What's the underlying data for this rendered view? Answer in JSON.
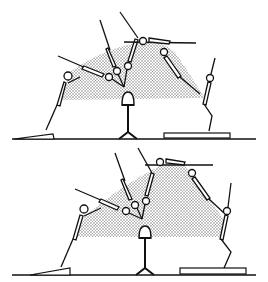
{
  "figure": {
    "ink_color": "#111111",
    "shade_color": "#bdbdbd",
    "background": "#ffffff",
    "panels": [
      {
        "id": "top",
        "label": ""
      },
      {
        "id": "bottom",
        "label": ""
      }
    ]
  }
}
